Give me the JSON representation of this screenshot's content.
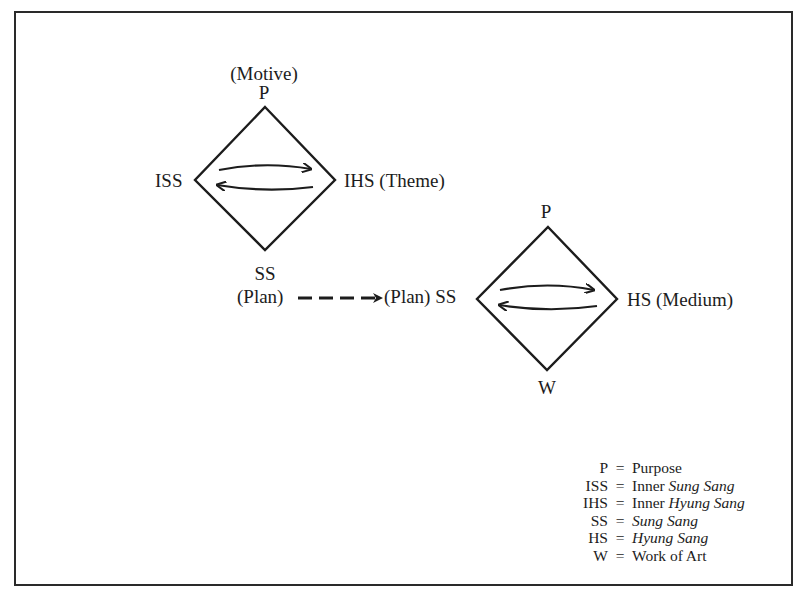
{
  "diagram": {
    "frame": {
      "border_color": "#2a2a2a",
      "background": "#ffffff"
    },
    "stage1": {
      "top_label_annotation": "(Motive)",
      "top_label": "P",
      "left_label": "ISS",
      "right_label": "IHS (Theme)",
      "bottom_label": "SS",
      "bottom_annotation": "(Plan)"
    },
    "connector": {
      "style": "dashed-arrow",
      "from": "(Plan)",
      "to_label": "(Plan) SS"
    },
    "stage2": {
      "top_label": "P",
      "left_label": "(Plan) SS",
      "right_label": "HS (Medium)",
      "bottom_label": "W"
    },
    "legend": [
      {
        "abbr": "P",
        "eq": "=",
        "plain": "Purpose",
        "italic": ""
      },
      {
        "abbr": "ISS",
        "eq": "=",
        "plain": "Inner ",
        "italic": "Sung Sang"
      },
      {
        "abbr": "IHS",
        "eq": "=",
        "plain": "Inner ",
        "italic": "Hyung Sang"
      },
      {
        "abbr": "SS",
        "eq": "=",
        "plain": "",
        "italic": "Sung Sang"
      },
      {
        "abbr": "HS",
        "eq": "=",
        "plain": "",
        "italic": "Hyung Sang"
      },
      {
        "abbr": "W",
        "eq": "=",
        "plain": "Work of Art",
        "italic": ""
      }
    ]
  }
}
